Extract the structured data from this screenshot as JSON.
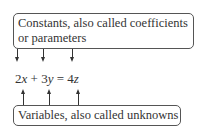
{
  "top_label": {
    "line1": "Constants, also called coefficients",
    "line2": "or parameters"
  },
  "equation": {
    "c1": "2",
    "v1": "x",
    "op1": " + ",
    "c2": "3",
    "v2": "y",
    "eq": " = ",
    "c3": "4",
    "v3": "z"
  },
  "bottom_label": "Variables, also called unknowns"
}
